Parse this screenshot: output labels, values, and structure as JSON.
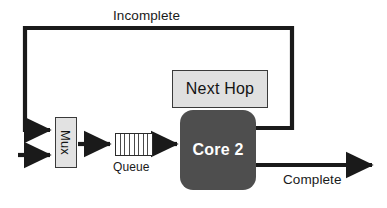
{
  "diagram": {
    "type": "block-flow-diagram",
    "canvas": {
      "width": 387,
      "height": 208,
      "background": "#ffffff"
    },
    "colors": {
      "line": "#1a1a1a",
      "core_fill": "#4e4e4e",
      "core_text": "#ffffff",
      "next_hop_fill": "#e0e0e0",
      "mux_fill": "#e2e2e2",
      "queue_fill": "#ffffff",
      "border": "#3a3a3a"
    },
    "nodes": {
      "mux": {
        "label": "Mux",
        "shape": "rectangle",
        "orientation": "vertical-text"
      },
      "queue": {
        "label": "Queue",
        "shape": "segmented-rectangle",
        "segments": 8
      },
      "core": {
        "label": "Core 2",
        "shape": "rounded-rectangle"
      },
      "next_hop": {
        "label": "Next Hop",
        "shape": "rectangle"
      }
    },
    "edges": {
      "incomplete": {
        "label": "Incomplete",
        "from": "core",
        "to": "mux",
        "style": "feedback-loop"
      },
      "complete": {
        "label": "Complete",
        "from": "core",
        "to": "output",
        "style": "arrow"
      },
      "input": {
        "label": "",
        "from": "external",
        "to": "mux",
        "style": "arrow"
      },
      "mux_to_queue": {
        "label": "",
        "from": "mux",
        "to": "queue",
        "style": "arrow"
      },
      "queue_to_core": {
        "label": "",
        "from": "queue",
        "to": "core",
        "style": "arrow"
      }
    }
  }
}
